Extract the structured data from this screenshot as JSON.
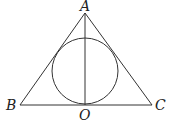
{
  "diagram": {
    "type": "geometry",
    "colors": {
      "stroke": "#333333",
      "label": "#222222",
      "background": "#ffffff"
    },
    "points": {
      "A": {
        "label": "A",
        "x": 85,
        "y": 13
      },
      "B": {
        "label": "B",
        "x": 20,
        "y": 105
      },
      "C": {
        "label": "C",
        "x": 152,
        "y": 105
      },
      "O": {
        "label": "O",
        "x": 85,
        "y": 105
      }
    },
    "circle": {
      "cx": 85,
      "cy": 71,
      "r": 33
    },
    "segments": [
      {
        "from": "A",
        "to": "B"
      },
      {
        "from": "A",
        "to": "C"
      },
      {
        "from": "B",
        "to": "C"
      },
      {
        "from": "A",
        "to": "O"
      }
    ],
    "labels": {
      "A": "A",
      "B": "B",
      "C": "C",
      "O": "O"
    }
  }
}
